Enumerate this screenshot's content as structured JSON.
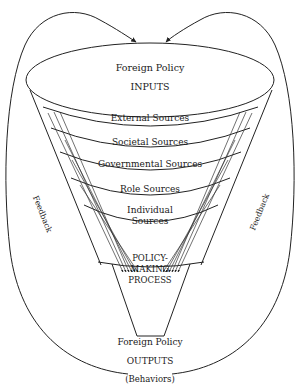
{
  "diagram": {
    "type": "funnel-flow",
    "inputs": {
      "title": "Foreign Policy",
      "label": "INPUTS"
    },
    "bands": [
      {
        "label": "External Sources"
      },
      {
        "label": "Societal Sources"
      },
      {
        "label": "Governmental Sources"
      },
      {
        "label": "Role Sources"
      },
      {
        "label_line1": "Individual",
        "label_line2": "Sources"
      }
    ],
    "process": {
      "line1": "POLICY-",
      "line2": "MAKING",
      "line3": "PROCESS"
    },
    "outputs": {
      "title": "Foreign Policy",
      "label": "OUTPUTS",
      "sublabel": "(Behaviors)"
    },
    "feedback": {
      "left_label": "Feedback",
      "right_label": "Feedback"
    },
    "colors": {
      "line": "#222222",
      "text": "#1a1a1a",
      "background": "#ffffff"
    }
  }
}
